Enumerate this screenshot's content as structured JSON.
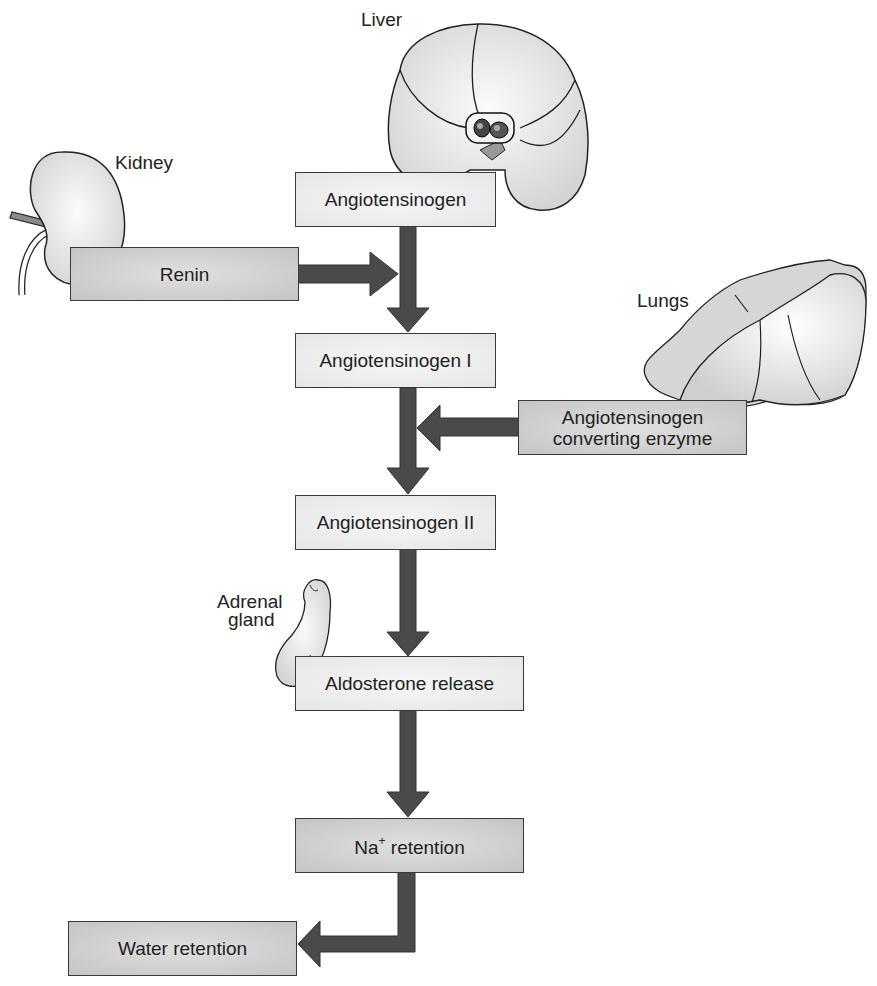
{
  "diagram": {
    "type": "flowchart",
    "organ_labels": {
      "liver": "Liver",
      "kidney": "Kidney",
      "lungs": "Lungs",
      "adrenal_line1": "Adrenal",
      "adrenal_line2": "gland"
    },
    "nodes": {
      "angiotensinogen": "Angiotensinogen",
      "renin": "Renin",
      "angiotensinogen_1": "Angiotensinogen I",
      "ace_line1": "Angiotensinogen",
      "ace_line2": "converting enzyme",
      "angiotensinogen_2": "Angiotensinogen II",
      "aldosterone": "Aldosterone release",
      "na_prefix": "Na",
      "na_sup": "+",
      "na_suffix": " retention",
      "water": "Water retention"
    },
    "edges": [
      {
        "from": "Angiotensinogen",
        "to": "Angiotensinogen I"
      },
      {
        "from": "Renin",
        "to": "Angiotensinogen → Angiotensinogen I arrow"
      },
      {
        "from": "Angiotensinogen I",
        "to": "Angiotensinogen II"
      },
      {
        "from": "Angiotensinogen converting enzyme",
        "to": "Angiotensinogen I → Angiotensinogen II arrow"
      },
      {
        "from": "Angiotensinogen II",
        "to": "Aldosterone release"
      },
      {
        "from": "Aldosterone release",
        "to": "Na+ retention"
      },
      {
        "from": "Na+ retention",
        "to": "Water retention"
      }
    ],
    "colors": {
      "arrow": "#4a4a4a",
      "box_light": "#ececec",
      "box_dark": "#cfcfcf",
      "organ_fill": "#e8e8e8",
      "outline": "#2a2a2a"
    }
  }
}
